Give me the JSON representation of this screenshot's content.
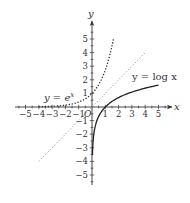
{
  "chart_data": {
    "type": "line",
    "title": "",
    "xlabel": "x",
    "ylabel": "y",
    "xlim": [
      -5.5,
      6
    ],
    "ylim": [
      -5.8,
      6.2
    ],
    "grid": false,
    "origin_label": "O",
    "x_ticks": [
      -5,
      -4,
      -3,
      -2,
      -1,
      1,
      2,
      3,
      4,
      5
    ],
    "y_ticks": [
      -5,
      -4,
      -3,
      -2,
      -1,
      1,
      2,
      3,
      4,
      5
    ],
    "x_tick_labels": [
      "−5",
      "−4",
      "−3",
      "−2",
      "−1",
      "1",
      "2",
      "3",
      "4",
      "5"
    ],
    "y_tick_labels": [
      "−5",
      "−4",
      "−3",
      "−2",
      "−1",
      "1",
      "2",
      "3",
      "4",
      "5"
    ],
    "series": [
      {
        "name": "y = e^x",
        "label_prefix": "y = e",
        "label_sup": "x",
        "style": "dotted",
        "color": "#333333",
        "x": [
          -4,
          -3,
          -2,
          -1.5,
          -1,
          -0.5,
          0,
          0.5,
          1,
          1.25,
          1.5,
          1.61
        ],
        "y": [
          0.018,
          0.05,
          0.135,
          0.223,
          0.368,
          0.607,
          1,
          1.649,
          2.718,
          3.49,
          4.48,
          5.0
        ]
      },
      {
        "name": "y = x",
        "style": "dotted-light",
        "color": "#999999",
        "x": [
          -4,
          4
        ],
        "y": [
          -4,
          4
        ]
      },
      {
        "name": "y = log x",
        "label_text": "y = log x",
        "style": "solid",
        "color": "#222222",
        "x": [
          0.03,
          0.05,
          0.08,
          0.12,
          0.2,
          0.3,
          0.5,
          0.75,
          1,
          1.5,
          2,
          3,
          4,
          5
        ],
        "y": [
          -3.51,
          -3.0,
          -2.53,
          -2.12,
          -1.61,
          -1.2,
          -0.69,
          -0.29,
          0,
          0.405,
          0.693,
          1.099,
          1.386,
          1.609
        ]
      }
    ]
  }
}
